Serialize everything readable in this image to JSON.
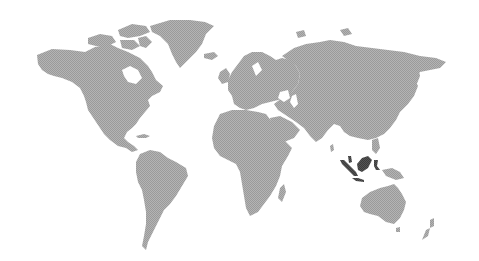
{
  "map": {
    "type": "world-choropleth",
    "projection": "equirectangular-like",
    "background_color": "#ffffff",
    "land_color": "#a9a9a9",
    "highlight_color": "#4a4a4a",
    "highlighted_regions": [
      "Indonesia"
    ],
    "style": "halftone-dotted",
    "legend": null,
    "title": null
  }
}
